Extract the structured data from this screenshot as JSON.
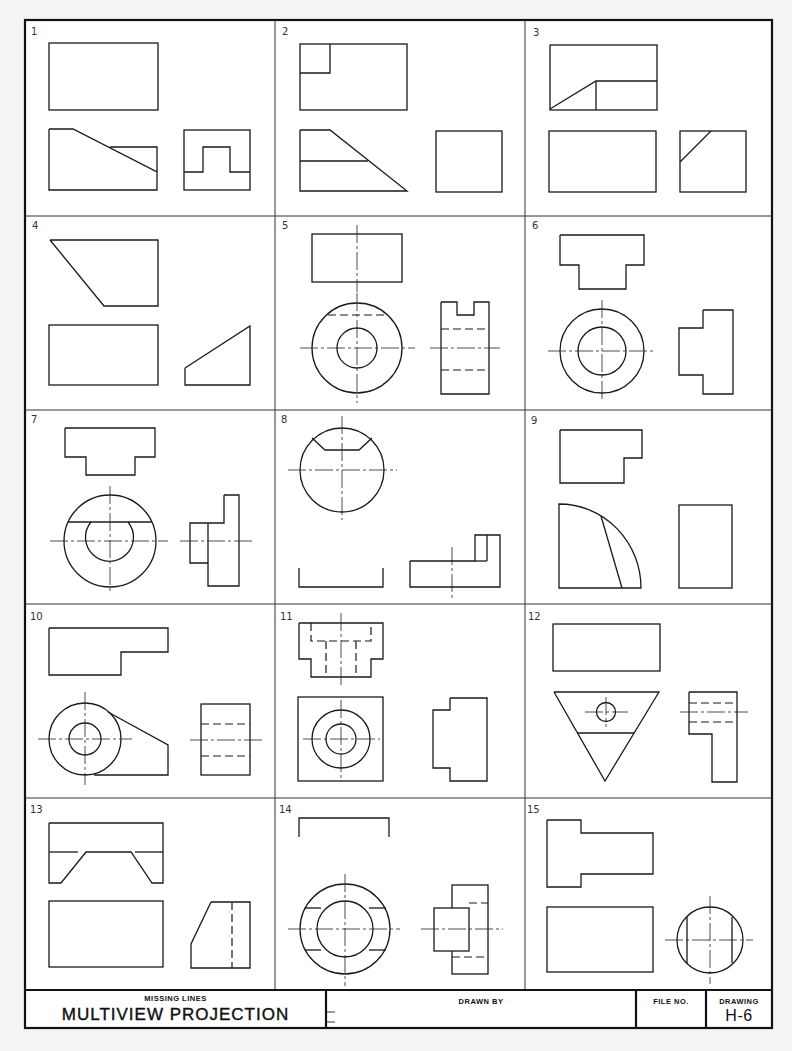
{
  "sheet": {
    "title_block": {
      "subtitle": "MISSING LINES",
      "title": "MULTIVIEW PROJECTION",
      "drawn_by_label": "DRAWN BY",
      "file_no_label": "FILE NO.",
      "drawing_label": "DRAWING",
      "drawing_number": "H-6"
    },
    "problems": [
      {
        "number": "1"
      },
      {
        "number": "2"
      },
      {
        "number": "3"
      },
      {
        "number": "4"
      },
      {
        "number": "5"
      },
      {
        "number": "6"
      },
      {
        "number": "7"
      },
      {
        "number": "8"
      },
      {
        "number": "9"
      },
      {
        "number": "10"
      },
      {
        "number": "11"
      },
      {
        "number": "12"
      },
      {
        "number": "13"
      },
      {
        "number": "14"
      },
      {
        "number": "15"
      }
    ]
  }
}
